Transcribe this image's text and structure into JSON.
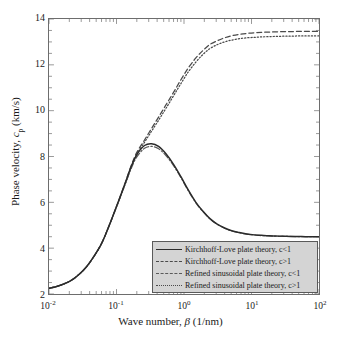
{
  "figure": {
    "background_color": "#ffffff",
    "frame_color": "#6d6d6d"
  },
  "axes": {
    "x": {
      "label_prefix": "Wave number, ",
      "label_symbol": "β",
      "label_units": " (1/nm)",
      "scale": "log",
      "ticks": [
        {
          "mantissa": "10",
          "exponent": "-2",
          "value": 0.01
        },
        {
          "mantissa": "10",
          "exponent": "-1",
          "value": 0.1
        },
        {
          "mantissa": "10",
          "exponent": "0",
          "value": 1
        },
        {
          "mantissa": "10",
          "exponent": "1",
          "value": 10
        },
        {
          "mantissa": "10",
          "exponent": "2",
          "value": 100
        }
      ],
      "range": [
        0.01,
        100
      ]
    },
    "y": {
      "label_prefix": "Phase velocity, ",
      "label_symbol": "c",
      "label_subscript": "p",
      "label_units": " (km/s)",
      "scale": "linear",
      "ticks": [
        "2",
        "4",
        "6",
        "8",
        "10",
        "12",
        "14"
      ],
      "range": [
        2,
        14
      ]
    }
  },
  "legend": {
    "position": "lower-right-inside",
    "background_color": "#d4d4d4",
    "border_color": "#5a5a5a",
    "entries": [
      {
        "label": "Kirchhoff-Love plate theory, c<1",
        "style": "solid",
        "color": "#2b2b2b"
      },
      {
        "label": "Kirchhoff-Love plate theory, c>1",
        "style": "dashed",
        "color": "#4a4a4a"
      },
      {
        "label": "Refined sinusoidal plate theory, c<1",
        "style": "dashdot",
        "color": "#5a5a5a"
      },
      {
        "label": "Refined sinusoidal plate theory, c>1",
        "style": "dotted",
        "color": "#4a4a4a"
      }
    ]
  },
  "chart_data": {
    "type": "line",
    "title": "",
    "xlabel": "Wave number, β (1/nm)",
    "ylabel": "Phase velocity, c_p (km/s)",
    "xscale": "log",
    "yscale": "linear",
    "xlim": [
      0.01,
      100
    ],
    "ylim": [
      2,
      14
    ],
    "grid": false,
    "legend_position": "lower right",
    "x": [
      0.01,
      0.013,
      0.017,
      0.022,
      0.028,
      0.036,
      0.046,
      0.06,
      0.077,
      0.1,
      0.13,
      0.165,
      0.2,
      0.26,
      0.33,
      0.42,
      0.54,
      0.7,
      0.9,
      1.15,
      1.5,
      1.9,
      2.4,
      3.1,
      4.0,
      5.1,
      6.6,
      8.5,
      11.0,
      14.0,
      18.0,
      23.0,
      30.0,
      38.0,
      49.0,
      63.0,
      81.0,
      100.0
    ],
    "series": [
      {
        "name": "Kirchhoff-Love plate theory, c<1",
        "style": "solid",
        "color": "#2b2b2b",
        "values": [
          2.25,
          2.33,
          2.45,
          2.62,
          2.86,
          3.19,
          3.63,
          4.2,
          4.95,
          5.82,
          6.72,
          7.56,
          8.08,
          8.48,
          8.56,
          8.44,
          8.12,
          7.66,
          7.12,
          6.55,
          6.0,
          5.62,
          5.3,
          5.05,
          4.88,
          4.76,
          4.68,
          4.62,
          4.58,
          4.56,
          4.54,
          4.53,
          4.52,
          4.51,
          4.51,
          4.5,
          4.5,
          4.5
        ]
      },
      {
        "name": "Kirchhoff-Love plate theory, c>1",
        "style": "dashed",
        "color": "#4a4a4a",
        "values": [
          2.25,
          2.33,
          2.45,
          2.62,
          2.86,
          3.19,
          3.63,
          4.2,
          4.95,
          5.82,
          6.72,
          7.6,
          8.18,
          8.72,
          9.22,
          9.72,
          10.25,
          10.8,
          11.35,
          11.85,
          12.3,
          12.62,
          12.88,
          13.05,
          13.18,
          13.27,
          13.33,
          13.37,
          13.4,
          13.42,
          13.43,
          13.44,
          13.45,
          13.45,
          13.46,
          13.46,
          13.46,
          13.46
        ]
      },
      {
        "name": "Refined sinusoidal plate theory, c<1",
        "style": "dashdot",
        "color": "#5a5a5a",
        "values": [
          2.25,
          2.33,
          2.45,
          2.62,
          2.86,
          3.19,
          3.63,
          4.2,
          4.95,
          5.8,
          6.68,
          7.48,
          7.98,
          8.36,
          8.44,
          8.34,
          8.04,
          7.6,
          7.08,
          6.52,
          5.98,
          5.6,
          5.29,
          5.04,
          4.87,
          4.75,
          4.67,
          4.61,
          4.58,
          4.55,
          4.54,
          4.52,
          4.52,
          4.51,
          4.5,
          4.5,
          4.5,
          4.5
        ]
      },
      {
        "name": "Refined sinusoidal plate theory, c>1",
        "style": "dotted",
        "color": "#4a4a4a",
        "values": [
          2.25,
          2.33,
          2.45,
          2.62,
          2.86,
          3.19,
          3.63,
          4.2,
          4.95,
          5.8,
          6.68,
          7.52,
          8.1,
          8.62,
          9.1,
          9.58,
          10.1,
          10.65,
          11.18,
          11.68,
          12.12,
          12.45,
          12.7,
          12.88,
          13.0,
          13.08,
          13.14,
          13.18,
          13.2,
          13.22,
          13.23,
          13.24,
          13.25,
          13.25,
          13.26,
          13.26,
          13.26,
          13.26
        ]
      }
    ]
  }
}
